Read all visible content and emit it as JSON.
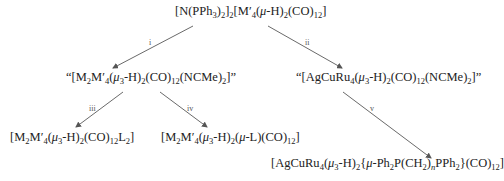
{
  "compounds": {
    "start": {
      "html": "[N(PPh<sub>3</sub>)<sub>2</sub>]<sub>2</sub>[M′<sub>4</sub>(<i>μ</i>-H)<sub>2</sub>(CO)<sub>12</sub>]"
    },
    "intermediate_left": {
      "html": "“[M<sub>2</sub>M′<sub>4</sub>(<i>μ</i><sub>3</sub>-H)<sub>2</sub>(CO)<sub>12</sub>(NCMe)<sub>2</sub>]”"
    },
    "intermediate_right": {
      "html": "“[AgCuRu<sub>4</sub>(<i>μ</i><sub>3</sub>-H)<sub>2</sub>(CO)<sub>12</sub>(NCMe)<sub>2</sub>]”"
    },
    "product_iii": {
      "html": "[M<sub>2</sub>M′<sub>4</sub>(<i>μ</i><sub>3</sub>-H)<sub>2</sub>(CO)<sub>12</sub>L<sub>2</sub>]"
    },
    "product_iv": {
      "html": "[M<sub>2</sub>M′<sub>4</sub>(<i>μ</i><sub>3</sub>-H)<sub>2</sub>(<i>μ</i>-L)(CO)<sub>12</sub>]"
    },
    "product_v": {
      "html": "[AgCuRu<sub>4</sub>(<i>μ</i><sub>3</sub>-H)<sub>2</sub>{<i>μ</i>-Ph<sub>2</sub>P(CH<sub>2</sub>)<sub><i>n</i></sub>PPh<sub>2</sub>}(CO)<sub>12</sub>]"
    }
  },
  "arrows": {
    "i": {
      "label": "i"
    },
    "ii": {
      "label": "ii"
    },
    "iii": {
      "label": "iii"
    },
    "iv": {
      "label": "iv"
    },
    "v": {
      "label": "v"
    }
  },
  "colors": {
    "arrow": "#6a6a6a",
    "text": "#222222"
  }
}
